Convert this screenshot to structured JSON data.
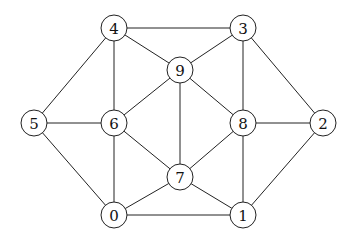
{
  "graph": {
    "nodes": [
      {
        "id": "0",
        "label": "0",
        "x": 114,
        "y": 215
      },
      {
        "id": "1",
        "label": "1",
        "x": 243,
        "y": 215
      },
      {
        "id": "2",
        "label": "2",
        "x": 323,
        "y": 123
      },
      {
        "id": "3",
        "label": "3",
        "x": 243,
        "y": 28
      },
      {
        "id": "4",
        "label": "4",
        "x": 114,
        "y": 28
      },
      {
        "id": "5",
        "label": "5",
        "x": 34,
        "y": 123
      },
      {
        "id": "6",
        "label": "6",
        "x": 114,
        "y": 123
      },
      {
        "id": "7",
        "label": "7",
        "x": 180,
        "y": 177
      },
      {
        "id": "8",
        "label": "8",
        "x": 243,
        "y": 123
      },
      {
        "id": "9",
        "label": "9",
        "x": 180,
        "y": 70
      }
    ],
    "edges": [
      [
        "4",
        "3"
      ],
      [
        "4",
        "5"
      ],
      [
        "4",
        "6"
      ],
      [
        "4",
        "9"
      ],
      [
        "3",
        "9"
      ],
      [
        "3",
        "8"
      ],
      [
        "3",
        "2"
      ],
      [
        "9",
        "6"
      ],
      [
        "9",
        "7"
      ],
      [
        "9",
        "8"
      ],
      [
        "5",
        "6"
      ],
      [
        "5",
        "0"
      ],
      [
        "6",
        "7"
      ],
      [
        "6",
        "0"
      ],
      [
        "8",
        "2"
      ],
      [
        "8",
        "7"
      ],
      [
        "8",
        "1"
      ],
      [
        "2",
        "1"
      ],
      [
        "7",
        "0"
      ],
      [
        "7",
        "1"
      ],
      [
        "0",
        "1"
      ]
    ],
    "node_radius": 13
  }
}
